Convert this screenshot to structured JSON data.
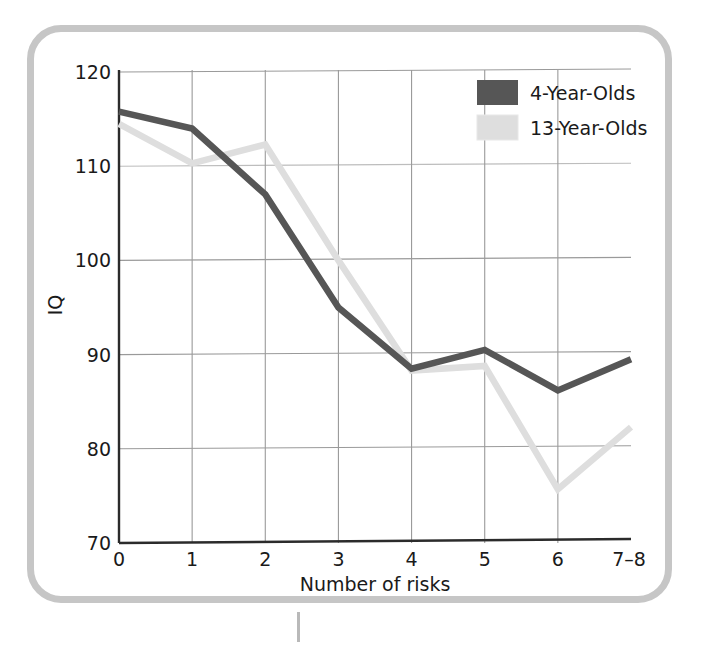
{
  "figure": {
    "frame_color": "#c6c6c6",
    "background": "#ffffff"
  },
  "chart_data": {
    "type": "line",
    "title": "",
    "xlabel": "Number of risks",
    "ylabel": "IQ",
    "categories": [
      "0",
      "1",
      "2",
      "3",
      "4",
      "5",
      "6",
      "7–8"
    ],
    "x_tick_labels": [
      "0",
      "1",
      "2",
      "3",
      "4",
      "5",
      "6",
      "7–8"
    ],
    "y_tick_labels": [
      "70",
      "80",
      "90",
      "100",
      "110",
      "120"
    ],
    "y_ticks": [
      70,
      80,
      90,
      100,
      110,
      120
    ],
    "ylim": [
      70,
      120
    ],
    "grid": true,
    "legend_position": "top-right",
    "series": [
      {
        "name": "4-Year-Olds",
        "color": "#565656",
        "values": [
          115.8,
          114.0,
          107.0,
          95.0,
          88.5,
          90.5,
          86.2,
          89.5
        ]
      },
      {
        "name": "13-Year-Olds",
        "color": "#dedede",
        "values": [
          114.5,
          110.3,
          112.3,
          100.0,
          88.3,
          88.8,
          75.7,
          82.3
        ]
      }
    ]
  },
  "legend": {
    "items": [
      {
        "label": "4-Year-Olds",
        "color": "#565656"
      },
      {
        "label": "13-Year-Olds",
        "color": "#dedede"
      }
    ]
  },
  "axes": {
    "y_title": "IQ",
    "x_title": "Number of risks"
  }
}
